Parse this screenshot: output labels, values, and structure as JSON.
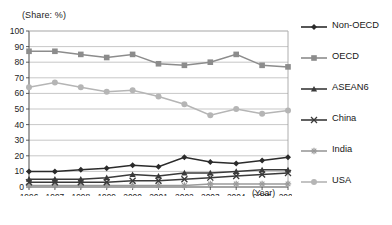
{
  "chart_data": {
    "type": "line",
    "title": "(Share: %)",
    "xlabel": "(Year)",
    "ylabel": "",
    "ylim": [
      0,
      100
    ],
    "ytick_step": 10,
    "grid": true,
    "legend_position": "right",
    "categories": [
      "1996",
      "1997",
      "1998",
      "1999",
      "2000",
      "2001",
      "2002",
      "2003",
      "2004",
      "2005",
      "2006"
    ],
    "series": [
      {
        "name": "Non-OECD",
        "marker": "diamond",
        "color": "#2b2b2b",
        "values": [
          10,
          10,
          11,
          12,
          14,
          13,
          19,
          16,
          15,
          17,
          19
        ]
      },
      {
        "name": "OECD",
        "marker": "square",
        "color": "#8c8c8c",
        "values": [
          87,
          87,
          85,
          83,
          85,
          79,
          78,
          80,
          85,
          78,
          77
        ]
      },
      {
        "name": "ASEAN6",
        "marker": "triangle",
        "color": "#3a3a3a",
        "values": [
          5,
          5,
          5,
          6,
          8,
          7,
          9,
          9,
          10,
          11,
          11
        ]
      },
      {
        "name": "China",
        "marker": "cross-x",
        "color": "#3a3a3a",
        "values": [
          3,
          3,
          3,
          3,
          4,
          4,
          5,
          6,
          7,
          8,
          9
        ]
      },
      {
        "name": "India",
        "marker": "asterisk",
        "color": "#9a9a9a",
        "values": [
          1,
          1,
          1,
          1,
          1,
          1,
          1,
          2,
          2,
          2,
          2
        ]
      },
      {
        "name": "USA",
        "marker": "circle",
        "color": "#b5b5b5",
        "values": [
          64,
          67,
          64,
          61,
          62,
          58,
          53,
          46,
          50,
          47,
          49
        ]
      }
    ]
  },
  "axes": {
    "y_ticks": [
      "100",
      "90",
      "80",
      "70",
      "60",
      "50",
      "40",
      "30",
      "20",
      "10",
      "0"
    ],
    "x_ticks": [
      "1996",
      "1997",
      "1998",
      "1999",
      "2000",
      "2001",
      "2002",
      "2003",
      "2004",
      "2005",
      "2006"
    ],
    "x_unit_label": "(Year)",
    "y_unit_label": "(Share: %)"
  },
  "legend": {
    "items": [
      {
        "label": "Non-OECD"
      },
      {
        "label": "OECD"
      },
      {
        "label": "ASEAN6"
      },
      {
        "label": "China"
      },
      {
        "label": "India"
      },
      {
        "label": "USA"
      }
    ]
  }
}
